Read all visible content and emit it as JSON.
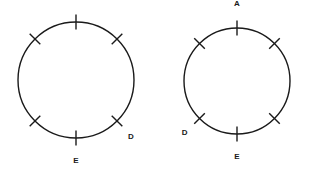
{
  "figure": {
    "background_color": "#ffffff",
    "stroke_color": "#1a1a1a",
    "label_color": "#1a1a1a",
    "circle_stroke_width": 1.4,
    "tick_stroke_width": 1.4,
    "tick_length": 15,
    "label_font_size": 8,
    "diagrams": [
      {
        "id": "left-circle",
        "name": "left-circle-diagram",
        "center_x": 76,
        "center_y": 80,
        "radius": 58,
        "ticks": [
          {
            "name": "tick-top",
            "angle_deg": 90,
            "label": "A",
            "label_dx": 0,
            "label_dy": -22,
            "label_anchor": "middle"
          },
          {
            "name": "tick-upper-right",
            "angle_deg": 45,
            "label": "",
            "label_dx": 0,
            "label_dy": 0,
            "label_anchor": "middle"
          },
          {
            "name": "tick-lower-right",
            "angle_deg": -45,
            "label": "D",
            "label_dx": 14,
            "label_dy": 18,
            "label_anchor": "middle"
          },
          {
            "name": "tick-bottom",
            "angle_deg": -90,
            "label": "E",
            "label_dx": 0,
            "label_dy": 25,
            "label_anchor": "middle"
          },
          {
            "name": "tick-lower-left",
            "angle_deg": -135,
            "label": "",
            "label_dx": 0,
            "label_dy": 0,
            "label_anchor": "middle"
          },
          {
            "name": "tick-upper-left",
            "angle_deg": 135,
            "label": "",
            "label_dx": 0,
            "label_dy": 0,
            "label_anchor": "middle"
          }
        ]
      },
      {
        "id": "right-circle",
        "name": "right-circle-diagram",
        "center_x": 237,
        "center_y": 81,
        "radius": 53,
        "ticks": [
          {
            "name": "tick-top",
            "angle_deg": 90,
            "label": "A",
            "label_dx": 0,
            "label_dy": -22,
            "label_anchor": "middle"
          },
          {
            "name": "tick-upper-right",
            "angle_deg": 45,
            "label": "",
            "label_dx": 0,
            "label_dy": 0,
            "label_anchor": "middle"
          },
          {
            "name": "tick-lower-right",
            "angle_deg": -45,
            "label": "",
            "label_dx": 0,
            "label_dy": 0,
            "label_anchor": "middle"
          },
          {
            "name": "tick-bottom",
            "angle_deg": -90,
            "label": "E",
            "label_dx": 0,
            "label_dy": 25,
            "label_anchor": "middle"
          },
          {
            "name": "tick-lower-left",
            "angle_deg": -135,
            "label": "D",
            "label_dx": -15,
            "label_dy": 17,
            "label_anchor": "middle"
          },
          {
            "name": "tick-upper-left",
            "angle_deg": 135,
            "label": "",
            "label_dx": 0,
            "label_dy": 0,
            "label_anchor": "middle"
          }
        ]
      }
    ]
  }
}
